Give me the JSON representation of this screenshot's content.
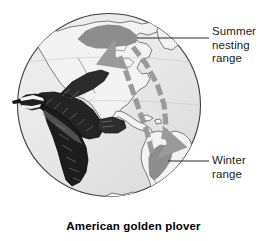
{
  "figure": {
    "caption": "American golden plover",
    "globe": {
      "shape": "sphere",
      "ocean_fill": "#e9e9e9",
      "outline_color": "#3a3a3a",
      "land_fill": "#f2f2f2",
      "land_outline": "#4a4a4a",
      "center_x": 109,
      "center_y": 105,
      "radius": 92
    },
    "legend": [
      {
        "key": "summer",
        "lines": [
          "Summer",
          "nesting",
          "range"
        ],
        "text": "Summer nesting range",
        "swatch_color": "#8d8d8d",
        "leader_from_x": 137,
        "leader_to_x": 209,
        "leader_y": 38
      },
      {
        "key": "winter",
        "lines": [
          "Winter",
          "range"
        ],
        "text": "Winter range",
        "swatch_color": "#8d8d8d",
        "leader_from_x": 168,
        "leader_to_x": 209,
        "leader_y": 161
      }
    ],
    "ranges": [
      {
        "name": "summer-nesting-range",
        "label": "Summer nesting range",
        "region": "Arctic northern Canada and Alaska",
        "color": "#8d8d8d"
      },
      {
        "name": "winter-range",
        "label": "Winter range",
        "region": "Southern South America (Argentina pampas)",
        "color": "#8d8d8d"
      }
    ],
    "migration_routes": [
      {
        "name": "northbound-spring-route",
        "direction": "north",
        "description": "Spring migration north through central North America",
        "color": "#9a9a9a"
      },
      {
        "name": "southbound-fall-route",
        "direction": "south",
        "description": "Fall migration south over the western Atlantic",
        "color": "#9a9a9a"
      }
    ],
    "bird": {
      "name": "american-golden-plover-illustration",
      "style": "engraving",
      "pose": "in flight, facing left",
      "color": "#1c1c1c"
    }
  }
}
